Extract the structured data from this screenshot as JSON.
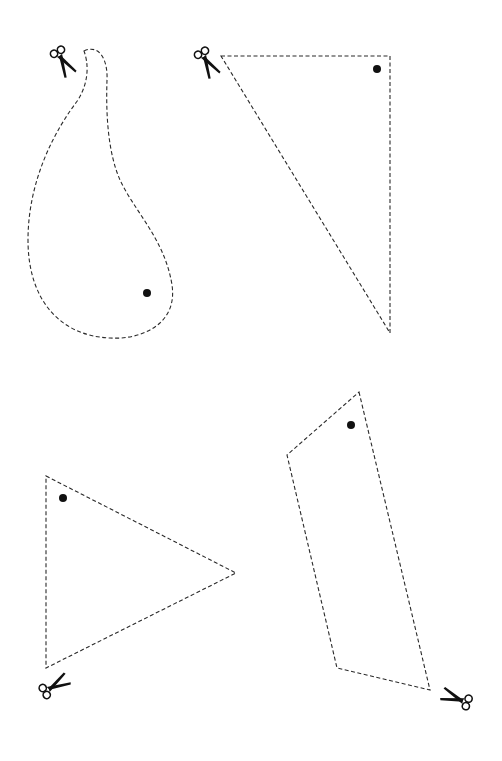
{
  "worksheet": {
    "title": "Cut-out shapes",
    "line_style": "dashed",
    "colors": {
      "line": "#2a2a2a",
      "ink": "#111111",
      "background": "#ffffff"
    },
    "shapes": [
      {
        "id": "paisley",
        "label": "Paisley / teardrop shape",
        "has_hole_dot": true,
        "scissors_position": "top-left"
      },
      {
        "id": "right-triangle",
        "label": "Right triangle",
        "has_hole_dot": true,
        "scissors_position": "top-left"
      },
      {
        "id": "triangle",
        "label": "Triangle",
        "has_hole_dot": true,
        "scissors_position": "bottom-left"
      },
      {
        "id": "quadrilateral",
        "label": "Quadrilateral",
        "has_hole_dot": true,
        "scissors_position": "bottom-right"
      }
    ],
    "icons": [
      "scissors-icon",
      "hole-dot-icon"
    ]
  }
}
